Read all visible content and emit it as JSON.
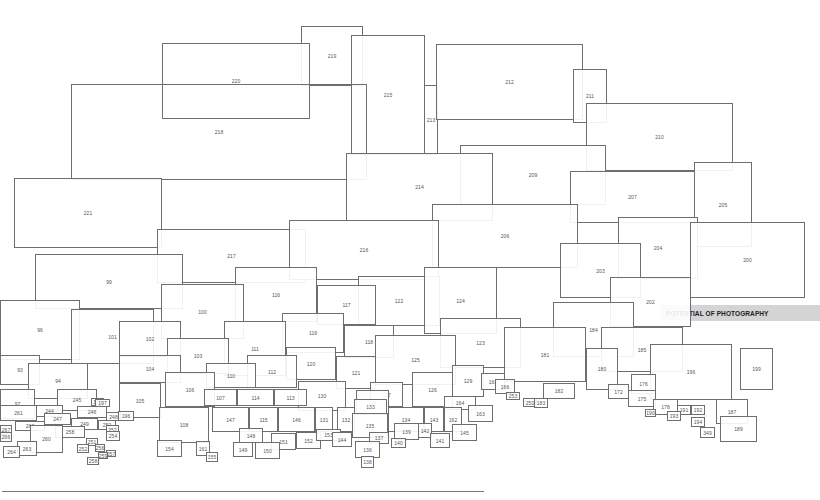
{
  "diagram": {
    "label": "POTENTIAL OF PHOTOGRAPHY",
    "colors": {
      "stroke": "#6e6e6e",
      "label_bg": "#d4d4d4",
      "text": "#555555"
    },
    "boxes": [
      {
        "id": "219",
        "x": 301,
        "y": 26,
        "w": 62,
        "h": 60
      },
      {
        "id": "220",
        "x": 162,
        "y": 43,
        "w": 148,
        "h": 76
      },
      {
        "id": "215",
        "x": 351,
        "y": 35,
        "w": 74,
        "h": 120
      },
      {
        "id": "213",
        "x": 424,
        "y": 85,
        "w": 14,
        "h": 70,
        "open": true
      },
      {
        "id": "212",
        "x": 436,
        "y": 44,
        "w": 147,
        "h": 76
      },
      {
        "id": "211",
        "x": 573,
        "y": 69,
        "w": 34,
        "h": 54
      },
      {
        "id": "210",
        "x": 586,
        "y": 103,
        "w": 147,
        "h": 68
      },
      {
        "id": "218",
        "x": 71,
        "y": 84,
        "w": 296,
        "h": 96,
        "open": true
      },
      {
        "id": "209",
        "x": 460,
        "y": 145,
        "w": 146,
        "h": 60
      },
      {
        "id": "214",
        "x": 346,
        "y": 153,
        "w": 147,
        "h": 68
      },
      {
        "id": "207",
        "x": 570,
        "y": 171,
        "w": 125,
        "h": 52
      },
      {
        "id": "205",
        "x": 694,
        "y": 162,
        "w": 58,
        "h": 85
      },
      {
        "id": "221",
        "x": 14,
        "y": 178,
        "w": 148,
        "h": 70
      },
      {
        "id": "206",
        "x": 432,
        "y": 204,
        "w": 146,
        "h": 64
      },
      {
        "id": "204",
        "x": 618,
        "y": 217,
        "w": 80,
        "h": 62
      },
      {
        "id": "217",
        "x": 157,
        "y": 229,
        "w": 149,
        "h": 54
      },
      {
        "id": "216",
        "x": 289,
        "y": 220,
        "w": 150,
        "h": 60
      },
      {
        "id": "200",
        "x": 690,
        "y": 222,
        "w": 115,
        "h": 76
      },
      {
        "id": "203",
        "x": 560,
        "y": 243,
        "w": 81,
        "h": 55
      },
      {
        "id": "99",
        "x": 35,
        "y": 254,
        "w": 148,
        "h": 55
      },
      {
        "id": "116",
        "x": 235,
        "y": 267,
        "w": 82,
        "h": 55
      },
      {
        "id": "122",
        "x": 358,
        "y": 276,
        "w": 82,
        "h": 50
      },
      {
        "id": "124",
        "x": 424,
        "y": 267,
        "w": 73,
        "h": 67
      },
      {
        "id": "202",
        "x": 610,
        "y": 277,
        "w": 81,
        "h": 50
      },
      {
        "id": "100",
        "x": 161,
        "y": 284,
        "w": 83,
        "h": 55
      },
      {
        "id": "117",
        "x": 317,
        "y": 285,
        "w": 59,
        "h": 40
      },
      {
        "id": "96",
        "x": 0,
        "y": 300,
        "w": 80,
        "h": 60
      },
      {
        "id": "101",
        "x": 71,
        "y": 309,
        "w": 83,
        "h": 55
      },
      {
        "id": "184",
        "x": 553,
        "y": 302,
        "w": 81,
        "h": 55
      },
      {
        "id": "119",
        "x": 282,
        "y": 313,
        "w": 62,
        "h": 40
      },
      {
        "id": "123",
        "x": 440,
        "y": 318,
        "w": 81,
        "h": 50
      },
      {
        "id": "102",
        "x": 119,
        "y": 321,
        "w": 62,
        "h": 36
      },
      {
        "id": "111",
        "x": 224,
        "y": 321,
        "w": 62,
        "h": 55
      },
      {
        "id": "118",
        "x": 344,
        "y": 325,
        "w": 50,
        "h": 33
      },
      {
        "id": "125",
        "x": 375,
        "y": 335,
        "w": 81,
        "h": 50
      },
      {
        "id": "181",
        "x": 504,
        "y": 327,
        "w": 82,
        "h": 55
      },
      {
        "id": "185",
        "x": 601,
        "y": 327,
        "w": 82,
        "h": 45
      },
      {
        "id": "103",
        "x": 167,
        "y": 338,
        "w": 62,
        "h": 36
      },
      {
        "id": "120",
        "x": 286,
        "y": 347,
        "w": 50,
        "h": 33
      },
      {
        "id": "180",
        "x": 586,
        "y": 348,
        "w": 32,
        "h": 42
      },
      {
        "id": "196",
        "x": 650,
        "y": 344,
        "w": 82,
        "h": 56
      },
      {
        "id": "199",
        "x": 740,
        "y": 348,
        "w": 33,
        "h": 42
      },
      {
        "id": "93",
        "x": 0,
        "y": 355,
        "w": 40,
        "h": 30
      },
      {
        "id": "104",
        "x": 119,
        "y": 355,
        "w": 62,
        "h": 28
      },
      {
        "id": "112",
        "x": 247,
        "y": 355,
        "w": 50,
        "h": 33
      },
      {
        "id": "121",
        "x": 336,
        "y": 356,
        "w": 40,
        "h": 33
      },
      {
        "id": "94",
        "x": 28,
        "y": 363,
        "w": 60,
        "h": 36
      },
      {
        "id": "110",
        "x": 206,
        "y": 363,
        "w": 50,
        "h": 25
      },
      {
        "id": "106",
        "x": 165,
        "y": 372,
        "w": 50,
        "h": 35
      },
      {
        "id": "129",
        "x": 452,
        "y": 365,
        "w": 32,
        "h": 32
      },
      {
        "id": "168",
        "x": 481,
        "y": 373,
        "w": 24,
        "h": 17
      },
      {
        "id": "176",
        "x": 631,
        "y": 374,
        "w": 25,
        "h": 20
      },
      {
        "id": "166",
        "x": 495,
        "y": 379,
        "w": 20,
        "h": 15
      },
      {
        "id": "126",
        "x": 412,
        "y": 372,
        "w": 41,
        "h": 35
      },
      {
        "id": "130",
        "x": 298,
        "y": 381,
        "w": 48,
        "h": 30
      },
      {
        "id": "97",
        "x": 0,
        "y": 389,
        "w": 35,
        "h": 30
      },
      {
        "id": "105",
        "x": 119,
        "y": 383,
        "w": 42,
        "h": 35
      },
      {
        "id": "245",
        "x": 57,
        "y": 389,
        "w": 40,
        "h": 22
      },
      {
        "id": "127",
        "x": 370,
        "y": 382,
        "w": 33,
        "h": 25
      },
      {
        "id": "128",
        "x": 356,
        "y": 390,
        "w": 33,
        "h": 25
      },
      {
        "id": "182",
        "x": 543,
        "y": 383,
        "w": 32,
        "h": 16
      },
      {
        "id": "172",
        "x": 608,
        "y": 384,
        "w": 21,
        "h": 15
      },
      {
        "id": "175",
        "x": 628,
        "y": 390,
        "w": 28,
        "h": 17
      },
      {
        "id": "107",
        "x": 204,
        "y": 389,
        "w": 33,
        "h": 17
      },
      {
        "id": "114",
        "x": 237,
        "y": 389,
        "w": 37,
        "h": 17
      },
      {
        "id": "113",
        "x": 274,
        "y": 389,
        "w": 33,
        "h": 17
      },
      {
        "id": "253",
        "x": 506,
        "y": 392,
        "w": 14,
        "h": 8
      },
      {
        "id": "186",
        "x": 91,
        "y": 398,
        "w": 13,
        "h": 8
      },
      {
        "id": "197",
        "x": 95,
        "y": 399,
        "w": 15,
        "h": 8
      },
      {
        "id": "250",
        "x": 523,
        "y": 398,
        "w": 14,
        "h": 9
      },
      {
        "id": "183",
        "x": 534,
        "y": 398,
        "w": 14,
        "h": 10
      },
      {
        "id": "178",
        "x": 653,
        "y": 399,
        "w": 25,
        "h": 16
      },
      {
        "id": "164",
        "x": 444,
        "y": 396,
        "w": 32,
        "h": 14
      },
      {
        "id": "133",
        "x": 354,
        "y": 399,
        "w": 33,
        "h": 15
      },
      {
        "id": "187",
        "x": 716,
        "y": 399,
        "w": 32,
        "h": 25
      },
      {
        "id": "261",
        "x": 0,
        "y": 405,
        "w": 37,
        "h": 16
      },
      {
        "id": "244",
        "x": 36,
        "y": 405,
        "w": 27,
        "h": 12
      },
      {
        "id": "246",
        "x": 77,
        "y": 406,
        "w": 30,
        "h": 12
      },
      {
        "id": "248",
        "x": 106,
        "y": 412,
        "w": 15,
        "h": 9
      },
      {
        "id": "196b",
        "label": "196",
        "x": 118,
        "y": 411,
        "w": 16,
        "h": 10
      },
      {
        "id": "108",
        "x": 159,
        "y": 407,
        "w": 50,
        "h": 36
      },
      {
        "id": "147",
        "x": 212,
        "y": 407,
        "w": 37,
        "h": 25
      },
      {
        "id": "115",
        "x": 249,
        "y": 407,
        "w": 29,
        "h": 25
      },
      {
        "id": "146",
        "x": 278,
        "y": 407,
        "w": 37,
        "h": 25
      },
      {
        "id": "131",
        "x": 315,
        "y": 407,
        "w": 18,
        "h": 25
      },
      {
        "id": "132",
        "x": 337,
        "y": 407,
        "w": 18,
        "h": 25
      },
      {
        "id": "134",
        "x": 388,
        "y": 407,
        "w": 36,
        "h": 25
      },
      {
        "id": "143",
        "x": 424,
        "y": 407,
        "w": 20,
        "h": 25
      },
      {
        "id": "162",
        "x": 444,
        "y": 407,
        "w": 18,
        "h": 25
      },
      {
        "id": "163",
        "x": 468,
        "y": 405,
        "w": 25,
        "h": 17
      },
      {
        "id": "191",
        "x": 677,
        "y": 405,
        "w": 14,
        "h": 10
      },
      {
        "id": "192",
        "x": 691,
        "y": 405,
        "w": 14,
        "h": 10
      },
      {
        "id": "190",
        "x": 645,
        "y": 409,
        "w": 11,
        "h": 8
      },
      {
        "id": "193",
        "x": 667,
        "y": 411,
        "w": 14,
        "h": 10
      },
      {
        "id": "194",
        "x": 691,
        "y": 417,
        "w": 14,
        "h": 10
      },
      {
        "id": "189",
        "x": 720,
        "y": 416,
        "w": 37,
        "h": 26
      },
      {
        "id": "349",
        "x": 700,
        "y": 427,
        "w": 15,
        "h": 11
      },
      {
        "id": "135",
        "x": 352,
        "y": 413,
        "w": 36,
        "h": 25
      },
      {
        "id": "247",
        "x": 44,
        "y": 413,
        "w": 27,
        "h": 12
      },
      {
        "id": "249",
        "x": 71,
        "y": 418,
        "w": 27,
        "h": 12
      },
      {
        "id": "250b",
        "label": "250",
        "x": 98,
        "y": 420,
        "w": 18,
        "h": 10
      },
      {
        "id": "252",
        "x": 106,
        "y": 425,
        "w": 13,
        "h": 9
      },
      {
        "id": "262",
        "x": 15,
        "y": 421,
        "w": 30,
        "h": 10
      },
      {
        "id": "258",
        "x": 55,
        "y": 426,
        "w": 30,
        "h": 12
      },
      {
        "id": "260",
        "x": 30,
        "y": 425,
        "w": 33,
        "h": 28
      },
      {
        "id": "254",
        "x": 106,
        "y": 431,
        "w": 14,
        "h": 10
      },
      {
        "id": "267",
        "x": 0,
        "y": 425,
        "w": 12,
        "h": 10
      },
      {
        "id": "266",
        "x": 0,
        "y": 432,
        "w": 12,
        "h": 10
      },
      {
        "id": "139",
        "x": 394,
        "y": 423,
        "w": 25,
        "h": 17
      },
      {
        "id": "142",
        "x": 418,
        "y": 423,
        "w": 14,
        "h": 15
      },
      {
        "id": "145",
        "x": 452,
        "y": 424,
        "w": 25,
        "h": 17
      },
      {
        "id": "152",
        "x": 296,
        "y": 432,
        "w": 25,
        "h": 17
      },
      {
        "id": "153",
        "x": 316,
        "y": 429,
        "w": 25,
        "h": 12
      },
      {
        "id": "144",
        "x": 332,
        "y": 432,
        "w": 20,
        "h": 15
      },
      {
        "id": "148",
        "x": 239,
        "y": 428,
        "w": 24,
        "h": 15
      },
      {
        "id": "151",
        "x": 271,
        "y": 433,
        "w": 25,
        "h": 17
      },
      {
        "id": "137",
        "x": 369,
        "y": 432,
        "w": 20,
        "h": 12
      },
      {
        "id": "140",
        "x": 391,
        "y": 438,
        "w": 15,
        "h": 10
      },
      {
        "id": "141",
        "x": 430,
        "y": 433,
        "w": 20,
        "h": 15
      },
      {
        "id": "154",
        "x": 157,
        "y": 440,
        "w": 25,
        "h": 17
      },
      {
        "id": "161",
        "x": 196,
        "y": 441,
        "w": 14,
        "h": 15
      },
      {
        "id": "149",
        "x": 233,
        "y": 442,
        "w": 20,
        "h": 15
      },
      {
        "id": "150",
        "x": 255,
        "y": 442,
        "w": 25,
        "h": 17
      },
      {
        "id": "263",
        "x": 17,
        "y": 441,
        "w": 20,
        "h": 15
      },
      {
        "id": "264",
        "x": 3,
        "y": 446,
        "w": 17,
        "h": 12
      },
      {
        "id": "251",
        "x": 86,
        "y": 438,
        "w": 12,
        "h": 8
      },
      {
        "id": "252b",
        "label": "252",
        "x": 77,
        "y": 444,
        "w": 12,
        "h": 9
      },
      {
        "id": "256",
        "x": 95,
        "y": 444,
        "w": 10,
        "h": 8
      },
      {
        "id": "257",
        "x": 106,
        "y": 450,
        "w": 10,
        "h": 7
      },
      {
        "id": "259",
        "x": 98,
        "y": 452,
        "w": 10,
        "h": 7
      },
      {
        "id": "258b",
        "label": "258",
        "x": 87,
        "y": 457,
        "w": 12,
        "h": 8
      },
      {
        "id": "136",
        "x": 355,
        "y": 441,
        "w": 25,
        "h": 17
      },
      {
        "id": "138",
        "x": 361,
        "y": 456,
        "w": 13,
        "h": 12
      },
      {
        "id": "155",
        "x": 206,
        "y": 452,
        "w": 12,
        "h": 10
      }
    ]
  }
}
